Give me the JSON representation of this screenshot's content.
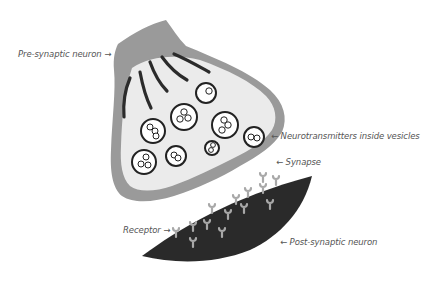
{
  "diagram": {
    "labels": {
      "presynaptic": "Pre-synaptic neuron →",
      "neurotransmitters": "←  Neurotransmitters inside vesicles",
      "synapse": "←   Synapse",
      "receptor": "Receptor →",
      "postsynaptic": "← Post-synaptic neuron"
    },
    "colors": {
      "membrane": "#9a9a9a",
      "cytoplasm": "#ebebeb",
      "filaments": "#2b2b2b",
      "vesicle_outline": "#222222",
      "postsynaptic": "#2a2a2a",
      "receptor": "#a8a8a8",
      "label_text": "#555555"
    },
    "vesicles": [
      {
        "cx": 206,
        "cy": 93,
        "r": 10,
        "molecules": 1
      },
      {
        "cx": 184,
        "cy": 117,
        "r": 13,
        "molecules": 3
      },
      {
        "cx": 153,
        "cy": 131,
        "r": 12,
        "molecules": 3
      },
      {
        "cx": 225,
        "cy": 125,
        "r": 13,
        "molecules": 3
      },
      {
        "cx": 254,
        "cy": 137,
        "r": 10,
        "molecules": 2
      },
      {
        "cx": 212,
        "cy": 148,
        "r": 7,
        "molecules": 2
      },
      {
        "cx": 176,
        "cy": 156,
        "r": 10,
        "molecules": 2
      },
      {
        "cx": 144,
        "cy": 162,
        "r": 12,
        "molecules": 3
      }
    ],
    "receptor_count": 14
  }
}
